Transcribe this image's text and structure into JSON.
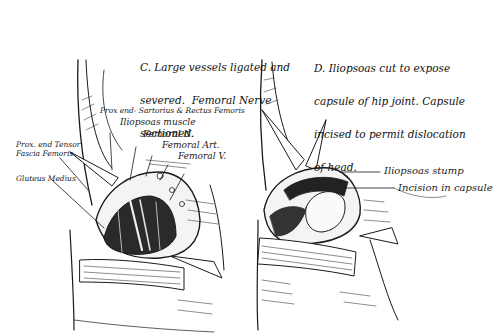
{
  "figure": {
    "panels": [
      {
        "id": "C",
        "caption_lines": [
          "C. Large vessels ligated and",
          "severed.  Femoral Nerve",
          "sectioned."
        ],
        "labels": [
          "Prox end- Sartorius & Rectus Femoris",
          "Iliopsoas muscle",
          "Femoral N.",
          "Femoral Art.",
          "Femoral V.",
          "Prox. end Tensor",
          "Fascia Femoris.",
          "Gluteus Medius"
        ]
      },
      {
        "id": "D",
        "caption_lines": [
          "D. Iliopsoas cut to expose",
          "capsule of hip joint. Capsule",
          "incised to permit dislocation",
          "of head."
        ],
        "labels": [
          "Iliopsoas stump",
          "Incision in capsule"
        ]
      }
    ],
    "colors": {
      "ink": "#1a1a1a",
      "paper": "#ffffff"
    }
  }
}
